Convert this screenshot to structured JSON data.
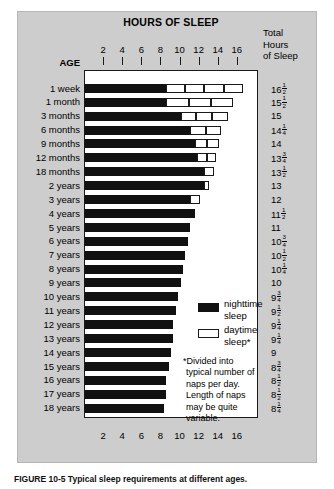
{
  "figure": {
    "title": "HOURS OF SLEEP",
    "age_header": "AGE",
    "total_header_lines": [
      "Total",
      "Hours",
      "of Sleep"
    ],
    "caption": "FIGURE 10-5  Typical sleep requirements at different ages."
  },
  "axis": {
    "ticks": [
      2,
      4,
      6,
      8,
      10,
      12,
      14,
      16
    ],
    "min": 0,
    "max": 18,
    "label": "HOURS OF SLEEP"
  },
  "legend": {
    "position": "inside-bottom-right",
    "items": [
      {
        "name": "nighttime-sleep",
        "label_line1": "nighttime",
        "label_line2": "sleep",
        "color": "#111111"
      },
      {
        "name": "daytime-sleep",
        "label_line1": "daytime",
        "label_line2": "sleep*",
        "color": "#ffffff"
      }
    ]
  },
  "footnote": "*Divided into typical number of naps per day. Length of naps may be quite variable.",
  "chart_data": {
    "type": "bar",
    "orientation": "horizontal",
    "stacked": true,
    "title": "HOURS OF SLEEP",
    "xlabel": "HOURS OF SLEEP",
    "ylabel": "AGE",
    "xlim": [
      0,
      18
    ],
    "xticks": [
      2,
      4,
      6,
      8,
      10,
      12,
      14,
      16
    ],
    "grid": false,
    "legend_position": "inside-bottom-right",
    "categories": [
      "1 week",
      "1 month",
      "3 months",
      "6 months",
      "9 months",
      "12 months",
      "18 months",
      "2 years",
      "3 years",
      "4 years",
      "5 years",
      "6 years",
      "7 years",
      "8 years",
      "9 years",
      "10 years",
      "11 years",
      "12 years",
      "13 years",
      "14 years",
      "15 years",
      "16 years",
      "17 years",
      "18 years"
    ],
    "series": [
      {
        "name": "nighttime sleep",
        "color": "#111111",
        "values": [
          8.5,
          8.5,
          10.0,
          11.0,
          11.5,
          11.75,
          12.5,
          12.5,
          11.0,
          11.5,
          11.0,
          10.75,
          10.5,
          10.25,
          10.0,
          9.75,
          9.5,
          9.25,
          9.25,
          9.0,
          8.75,
          8.5,
          8.5,
          8.25
        ]
      },
      {
        "name": "daytime sleep",
        "color": "#ffffff",
        "values": [
          8.0,
          7.0,
          5.0,
          3.5,
          2.5,
          2.0,
          1.0,
          0.5,
          1.0,
          0,
          0,
          0,
          0,
          0,
          0,
          0,
          0,
          0,
          0,
          0,
          0,
          0,
          0,
          0
        ],
        "nap_counts": [
          4,
          3,
          3,
          2,
          2,
          2,
          1,
          1,
          1,
          0,
          0,
          0,
          0,
          0,
          0,
          0,
          0,
          0,
          0,
          0,
          0,
          0,
          0,
          0
        ]
      }
    ],
    "totals": [
      "16½",
      "15½",
      "15",
      "14¼",
      "14",
      "13¾",
      "13½",
      "13",
      "12",
      "11½",
      "11",
      "10¾",
      "10½",
      "10¼",
      "10",
      "9¾",
      "9½",
      "9¼",
      "9¼",
      "9",
      "8¾",
      "8½",
      "8½",
      "8¼"
    ],
    "rows": [
      {
        "age": "1 week",
        "night": 8.5,
        "day": 8.0,
        "naps": 4,
        "total": "16",
        "frac_num": "1",
        "frac_den": "2"
      },
      {
        "age": "1 month",
        "night": 8.5,
        "day": 7.0,
        "naps": 3,
        "total": "15",
        "frac_num": "1",
        "frac_den": "2"
      },
      {
        "age": "3 months",
        "night": 10.0,
        "day": 5.0,
        "naps": 3,
        "total": "15",
        "frac_num": "",
        "frac_den": ""
      },
      {
        "age": "6 months",
        "night": 11.0,
        "day": 3.25,
        "naps": 2,
        "total": "14",
        "frac_num": "1",
        "frac_den": "4"
      },
      {
        "age": "9 months",
        "night": 11.5,
        "day": 2.5,
        "naps": 2,
        "total": "14",
        "frac_num": "",
        "frac_den": ""
      },
      {
        "age": "12 months",
        "night": 11.75,
        "day": 2.0,
        "naps": 2,
        "total": "13",
        "frac_num": "3",
        "frac_den": "4"
      },
      {
        "age": "18 months",
        "night": 12.5,
        "day": 1.0,
        "naps": 1,
        "total": "13",
        "frac_num": "1",
        "frac_den": "2"
      },
      {
        "age": "2 years",
        "night": 12.5,
        "day": 0.5,
        "naps": 1,
        "total": "13",
        "frac_num": "",
        "frac_den": ""
      },
      {
        "age": "3 years",
        "night": 11.0,
        "day": 1.0,
        "naps": 1,
        "total": "12",
        "frac_num": "",
        "frac_den": ""
      },
      {
        "age": "4 years",
        "night": 11.5,
        "day": 0,
        "naps": 0,
        "total": "11",
        "frac_num": "1",
        "frac_den": "2"
      },
      {
        "age": "5 years",
        "night": 11.0,
        "day": 0,
        "naps": 0,
        "total": "11",
        "frac_num": "",
        "frac_den": ""
      },
      {
        "age": "6 years",
        "night": 10.75,
        "day": 0,
        "naps": 0,
        "total": "10",
        "frac_num": "3",
        "frac_den": "4"
      },
      {
        "age": "7 years",
        "night": 10.5,
        "day": 0,
        "naps": 0,
        "total": "10",
        "frac_num": "1",
        "frac_den": "2"
      },
      {
        "age": "8 years",
        "night": 10.25,
        "day": 0,
        "naps": 0,
        "total": "10",
        "frac_num": "1",
        "frac_den": "4"
      },
      {
        "age": "9 years",
        "night": 10.0,
        "day": 0,
        "naps": 0,
        "total": "10",
        "frac_num": "",
        "frac_den": ""
      },
      {
        "age": "10 years",
        "night": 9.75,
        "day": 0,
        "naps": 0,
        "total": "9",
        "frac_num": "3",
        "frac_den": "4"
      },
      {
        "age": "11 years",
        "night": 9.5,
        "day": 0,
        "naps": 0,
        "total": "9",
        "frac_num": "1",
        "frac_den": "2"
      },
      {
        "age": "12 years",
        "night": 9.25,
        "day": 0,
        "naps": 0,
        "total": "9",
        "frac_num": "1",
        "frac_den": "4"
      },
      {
        "age": "13 years",
        "night": 9.25,
        "day": 0,
        "naps": 0,
        "total": "9",
        "frac_num": "1",
        "frac_den": "4"
      },
      {
        "age": "14 years",
        "night": 9.0,
        "day": 0,
        "naps": 0,
        "total": "9",
        "frac_num": "",
        "frac_den": ""
      },
      {
        "age": "15 years",
        "night": 8.75,
        "day": 0,
        "naps": 0,
        "total": "8",
        "frac_num": "3",
        "frac_den": "4"
      },
      {
        "age": "16 years",
        "night": 8.5,
        "day": 0,
        "naps": 0,
        "total": "8",
        "frac_num": "1",
        "frac_den": "2"
      },
      {
        "age": "17 years",
        "night": 8.5,
        "day": 0,
        "naps": 0,
        "total": "8",
        "frac_num": "1",
        "frac_den": "2"
      },
      {
        "age": "18 years",
        "night": 8.25,
        "day": 0,
        "naps": 0,
        "total": "8",
        "frac_num": "1",
        "frac_den": "4"
      }
    ]
  }
}
